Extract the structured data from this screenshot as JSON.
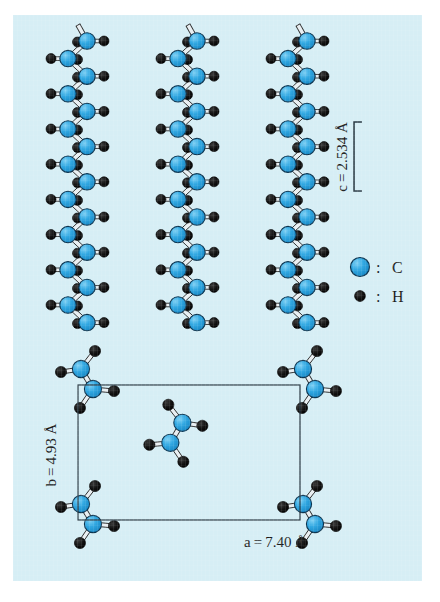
{
  "figure": {
    "panel_background": "#d6eef5",
    "page_background": "#ffffff"
  },
  "colors": {
    "carbon_fill": "#2aa3e0",
    "carbon_fill_light": "#5fc2ee",
    "carbon_stroke": "#0d3550",
    "hydrogen_fill": "#101010",
    "bond_fill": "#e9eff2",
    "bond_stroke": "#2a2a2a",
    "cell_line": "#2a3a44",
    "text": "#1a1a1a"
  },
  "labels": {
    "c_axis": "c = 2.534 Å",
    "c_axis_symbol": "c",
    "c_axis_value": "2.534 Å",
    "a_axis": "a = 7.40 Å",
    "a_axis_symbol": "a",
    "a_axis_value": "7.40 Å",
    "b_axis": "b = 4.93 Å",
    "b_axis_symbol": "b",
    "b_axis_value": "4.93 Å"
  },
  "legend": {
    "items": [
      {
        "symbol": "large-blue-circle",
        "separator": ":",
        "label": "C"
      },
      {
        "symbol": "small-black-dot",
        "separator": ":",
        "label": "H"
      }
    ]
  },
  "chart_data": {
    "type": "diagram",
    "lattice_parameters": {
      "a": 7.4,
      "b": 4.93,
      "c": 2.534,
      "units": "Å"
    },
    "atoms": {
      "C": "carbon",
      "H": "hydrogen"
    },
    "views": [
      {
        "name": "side-view-chains",
        "description": "Three planar zig-zag polyethylene chains viewed perpendicular to the chain axis; the c repeat distance of 2.534 Å spans two carbon atoms.",
        "chain_count": 3,
        "carbons_per_chain": 9,
        "hydrogens_per_carbon": 2
      },
      {
        "name": "projection-unit-cell",
        "description": "Projection down the c axis showing the orthorhombic unit cell with chains at the corners and one chain at the cell centre.",
        "cell_corners": 4,
        "centre_chains": 1,
        "a_edge_label": "a=7.40 Å",
        "b_edge_label": "b=4.93 Å"
      }
    ]
  },
  "geometry": {
    "chains": {
      "x_right": [
        74,
        184,
        294
      ],
      "x_left": [
        55,
        165,
        275
      ],
      "y_start": 26,
      "y_step": 17.6,
      "count": 17
    },
    "unit_cell": {
      "x": 65,
      "y": 370,
      "width": 222,
      "height": 135
    },
    "bracket": {
      "x": 341,
      "y_top": 107,
      "y_bottom": 176,
      "arm": 8
    }
  }
}
